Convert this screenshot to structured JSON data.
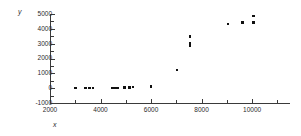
{
  "chart_data": {
    "type": "scatter",
    "title": "",
    "xlabel": "x",
    "ylabel": "y",
    "xlim": [
      2000,
      11500
    ],
    "ylim": [
      -1000,
      5000
    ],
    "grid": false,
    "legend": null,
    "x_ticks": [
      2000,
      4000,
      6000,
      8000,
      10000
    ],
    "x_tick_labels": [
      "2000",
      "4000",
      "6000",
      "8000",
      "10000"
    ],
    "x_minor_ticks": [
      3000,
      5000,
      7000,
      9000,
      11000
    ],
    "y_ticks": [
      -1000,
      0,
      1000,
      2000,
      3000,
      4000,
      5000
    ],
    "y_tick_labels": [
      "-1000",
      "0",
      "1000",
      "2000",
      "3000",
      "4000",
      "5000"
    ],
    "marker": "square",
    "marker_color": "#101010",
    "points": [
      {
        "x": 3000,
        "y": 0
      },
      {
        "x": 3400,
        "y": 0
      },
      {
        "x": 3560,
        "y": 0
      },
      {
        "x": 3700,
        "y": 0
      },
      {
        "x": 4480,
        "y": 0
      },
      {
        "x": 4600,
        "y": 20
      },
      {
        "x": 4700,
        "y": 0
      },
      {
        "x": 4950,
        "y": 40
      },
      {
        "x": 5150,
        "y": 60
      },
      {
        "x": 5280,
        "y": 90
      },
      {
        "x": 6000,
        "y": 120
      },
      {
        "x": 7020,
        "y": 1220
      },
      {
        "x": 7550,
        "y": 3480
      },
      {
        "x": 7550,
        "y": 3000
      },
      {
        "x": 7550,
        "y": 2880
      },
      {
        "x": 9050,
        "y": 4320
      },
      {
        "x": 9620,
        "y": 4420
      },
      {
        "x": 10050,
        "y": 4860
      },
      {
        "x": 10050,
        "y": 4440
      }
    ]
  }
}
